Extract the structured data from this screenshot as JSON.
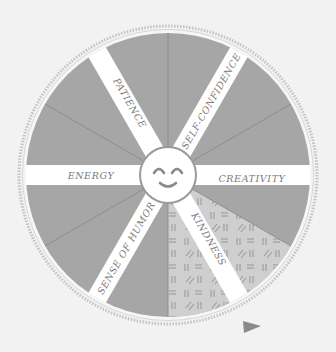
{
  "wheel": {
    "center": {
      "x": 168,
      "y": 175
    },
    "radius": 142,
    "ring_radius": 149,
    "colors": {
      "background": "#f2f2f2",
      "slice": "#a6a6a6",
      "slice_line": "#8a8a8a",
      "spoke": "#ffffff",
      "highlight_slice": "#cfcfcf",
      "hatch": "#9a9a9a",
      "ring": "#c4c4c4",
      "label": "#7a7a7a",
      "pointer": "#8a8a8a"
    },
    "spokes": [
      {
        "label": "PATIENCE",
        "angle": 240
      },
      {
        "label": "SELF-CONFIDENCE",
        "angle": 300
      },
      {
        "label": "ENERGY",
        "angle": 180
      },
      {
        "label": "CREATIVITY",
        "angle": 0
      },
      {
        "label": "SENSE OF HUMOR",
        "angle": 120
      },
      {
        "label": "KINDNESS",
        "angle": 60
      }
    ],
    "divider_angles": [
      270,
      90,
      210,
      330,
      150,
      30
    ],
    "highlighted_slice": {
      "start": 30,
      "end": 90,
      "label": "KINDNESS"
    },
    "center_icon": "smiley-face-icon",
    "pointer_icon": "play-triangle-icon"
  }
}
